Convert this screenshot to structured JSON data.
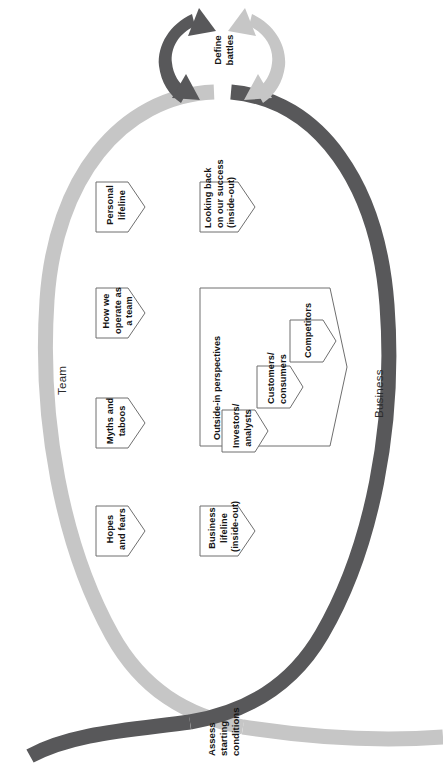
{
  "diagram": {
    "title_visible": false,
    "type": "process-loop",
    "colors": {
      "team_band": "#c6c6c6",
      "business_band": "#58585a",
      "box_stroke": "#6f6f6f",
      "box_fill": "#ffffff",
      "text": "#141414",
      "page_background": "#ffffff"
    },
    "cycle_node": {
      "label_line1": "Define",
      "label_line2": "battles",
      "arrow_left_color": "#58585a",
      "arrow_right_color": "#c6c6c6"
    },
    "entry_node": {
      "label_line1": "Assess",
      "label_line2": "starting",
      "label_line3": "conditions"
    },
    "branches": [
      {
        "name": "team",
        "label": "Team",
        "band_color": "#c6c6c6",
        "items": [
          {
            "id": "hopes-and-fears",
            "lines": [
              "Hopes",
              "and fears"
            ]
          },
          {
            "id": "myths-and-taboos",
            "lines": [
              "Myths and",
              "taboos"
            ]
          },
          {
            "id": "how-we-operate",
            "lines": [
              "How we",
              "operate as",
              "a team"
            ]
          },
          {
            "id": "personal-lifeline",
            "lines": [
              "Personal",
              "lifeline"
            ]
          }
        ]
      },
      {
        "name": "business",
        "label": "Business",
        "band_color": "#58585a",
        "items": [
          {
            "id": "business-lifeline",
            "lines": [
              "Business",
              "lifeline",
              "(inside-out)"
            ]
          },
          {
            "id": "looking-back",
            "lines": [
              "Looking back",
              "on our success",
              "(inside-out)"
            ]
          }
        ],
        "group": {
          "id": "outside-in-perspectives",
          "label": "Outside-in perspectives",
          "items": [
            {
              "id": "investors-analysts",
              "lines": [
                "Investors/",
                "analysts"
              ]
            },
            {
              "id": "customers-consumers",
              "lines": [
                "Customers/",
                "consumers"
              ]
            },
            {
              "id": "competitors",
              "lines": [
                "Competitors"
              ]
            }
          ]
        }
      }
    ]
  }
}
